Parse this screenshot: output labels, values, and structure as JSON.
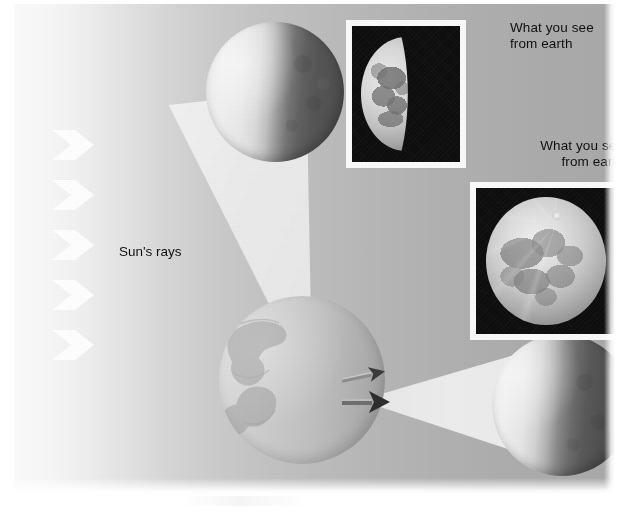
{
  "figure": {
    "width": 625,
    "height": 514,
    "background_color": "#ffffff"
  },
  "labels": {
    "suns_rays": "Sun's rays",
    "caption_top": "What you see\nfrom earth",
    "caption_right": "What you see\nfrom earth"
  },
  "colors": {
    "plate_light": "#fbfbfb",
    "plate_dark": "#a9a9a9",
    "moon_lit": "#efefef",
    "moon_dark": "#4e4e4e",
    "earth_fill": "#c9c9c9",
    "photo_background": "#0d0d0d",
    "photo_frame": "#fafafa",
    "text": "#101010"
  },
  "elements": {
    "sun_rays": {
      "name": "sun-rays-arrows",
      "count": 5,
      "direction": "right",
      "color": "#ffffff"
    },
    "moon_top": {
      "name": "moon-sphere-top",
      "phase": "half lit on left, dark on right",
      "lit_side": "left"
    },
    "moon_right": {
      "name": "moon-sphere-right",
      "phase": "half lit on left, dark on right",
      "lit_side": "left"
    },
    "earth": {
      "name": "earth-sphere",
      "lit_side": "left",
      "has_continents": true
    },
    "cone_upper": {
      "name": "viewing-cone-upper",
      "from": "earth",
      "to": "moon-sphere-top"
    },
    "cone_right": {
      "name": "viewing-cone-right",
      "from": "earth",
      "to": "moon-sphere-right"
    },
    "sight_arrow_upper": {
      "name": "sight-arrow-upper",
      "points_to": "moon-sphere-top"
    },
    "sight_arrow_right": {
      "name": "sight-arrow-right",
      "points_to": "moon-sphere-right"
    },
    "photo_first_quarter": {
      "name": "photo-first-quarter-moon",
      "subject": "first quarter moon",
      "framed": true
    },
    "photo_full_moon": {
      "name": "photo-full-moon",
      "subject": "full moon",
      "framed": true
    }
  }
}
